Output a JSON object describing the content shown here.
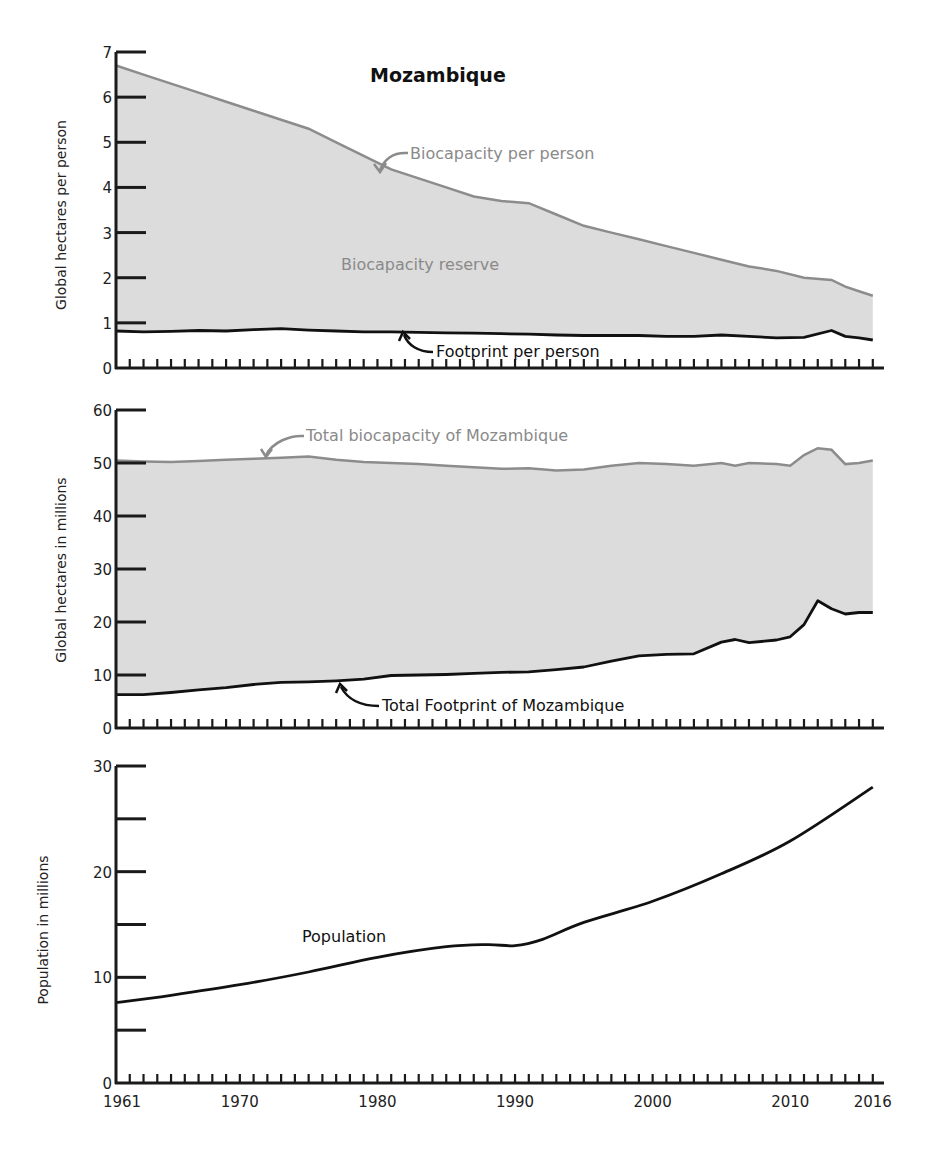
{
  "title": "Mozambique",
  "chart_data": [
    {
      "type": "area",
      "title": "Mozambique",
      "xlabel": "",
      "ylabel": "Global hectares per person",
      "ylim": [
        0,
        7
      ],
      "yticks": [
        "0",
        "1",
        "2",
        "3",
        "4",
        "5",
        "6",
        "7"
      ],
      "x": [
        1961,
        1963,
        1965,
        1967,
        1969,
        1971,
        1973,
        1975,
        1977,
        1979,
        1981,
        1983,
        1985,
        1987,
        1989,
        1991,
        1993,
        1995,
        1997,
        1999,
        2001,
        2003,
        2005,
        2007,
        2009,
        2011,
        2013,
        2014,
        2015,
        2016
      ],
      "series": [
        {
          "name": "Biocapacity per person",
          "color": "#8c8c8c",
          "values": [
            6.7,
            6.5,
            6.3,
            6.1,
            5.9,
            5.7,
            5.5,
            5.3,
            5.0,
            4.7,
            4.4,
            4.2,
            4.0,
            3.8,
            3.7,
            3.65,
            3.4,
            3.15,
            3.0,
            2.85,
            2.7,
            2.55,
            2.4,
            2.25,
            2.15,
            2.0,
            1.95,
            1.8,
            1.7,
            1.6
          ]
        },
        {
          "name": "Footprint per person",
          "color": "#111111",
          "values": [
            0.82,
            0.8,
            0.81,
            0.83,
            0.82,
            0.85,
            0.87,
            0.84,
            0.82,
            0.8,
            0.8,
            0.79,
            0.78,
            0.77,
            0.76,
            0.75,
            0.73,
            0.72,
            0.72,
            0.72,
            0.7,
            0.7,
            0.73,
            0.7,
            0.67,
            0.68,
            0.83,
            0.7,
            0.67,
            0.62
          ]
        }
      ],
      "annotations": [
        "Biocapacity per person",
        "Biocapacity reserve",
        "Footprint per person"
      ]
    },
    {
      "type": "area",
      "title": "",
      "ylabel": "Global hectares in millions",
      "ylim": [
        0,
        60
      ],
      "yticks": [
        "0",
        "10",
        "20",
        "30",
        "40",
        "50",
        "60"
      ],
      "x": [
        1961,
        1963,
        1965,
        1967,
        1969,
        1971,
        1973,
        1975,
        1977,
        1979,
        1981,
        1983,
        1985,
        1987,
        1989,
        1991,
        1993,
        1995,
        1997,
        1999,
        2001,
        2003,
        2005,
        2006,
        2007,
        2009,
        2010,
        2011,
        2012,
        2013,
        2014,
        2015,
        2016
      ],
      "series": [
        {
          "name": "Total biocapacity of Mozambique",
          "color": "#8c8c8c",
          "values": [
            50.5,
            50.3,
            50.2,
            50.4,
            50.6,
            50.8,
            51.0,
            51.2,
            50.6,
            50.2,
            50.0,
            49.8,
            49.5,
            49.2,
            48.9,
            49.0,
            48.6,
            48.8,
            49.5,
            50.0,
            49.8,
            49.5,
            50.0,
            49.5,
            50.0,
            49.8,
            49.5,
            51.5,
            52.8,
            52.5,
            49.8,
            50.0,
            50.5
          ]
        },
        {
          "name": "Total Footprint of Mozambique",
          "color": "#111111",
          "values": [
            6.3,
            6.3,
            6.7,
            7.2,
            7.6,
            8.2,
            8.6,
            8.7,
            8.9,
            9.2,
            9.9,
            10.0,
            10.1,
            10.3,
            10.5,
            10.6,
            11.0,
            11.5,
            12.6,
            13.6,
            13.9,
            14.0,
            16.2,
            16.7,
            16.1,
            16.6,
            17.2,
            19.5,
            24.0,
            22.5,
            21.5,
            21.8,
            21.8
          ]
        }
      ],
      "annotations": [
        "Total biocapacity of Mozambique",
        "Total Footprint of Mozambique"
      ]
    },
    {
      "type": "line",
      "title": "",
      "ylabel": "Population in millions",
      "ylim": [
        0,
        30
      ],
      "yticks": [
        "0",
        "",
        "10",
        "",
        "20",
        "",
        "30"
      ],
      "x": [
        1961,
        1965,
        1970,
        1975,
        1980,
        1985,
        1988,
        1990,
        1992,
        1995,
        2000,
        2005,
        2010,
        2016
      ],
      "series": [
        {
          "name": "Population",
          "color": "#111111",
          "values": [
            7.6,
            8.3,
            9.3,
            10.5,
            11.9,
            12.9,
            13.1,
            13.0,
            13.6,
            15.2,
            17.2,
            19.8,
            22.9,
            28.0
          ]
        }
      ],
      "xticks": [
        "1961",
        "1970",
        "1980",
        "1990",
        "2000",
        "2010",
        "2016"
      ],
      "annotations": [
        "Population"
      ]
    }
  ],
  "labels": {
    "bio_per_person": "Biocapacity per person",
    "reserve": "Biocapacity reserve",
    "fp_per_person": "Footprint per person",
    "total_bio": "Total biocapacity of Mozambique",
    "total_fp": "Total Footprint of Mozambique",
    "population": "Population",
    "ylabel_top": "Global hectares per person",
    "ylabel_mid": "Global hectares in millions",
    "ylabel_bot": "Population in millions"
  }
}
